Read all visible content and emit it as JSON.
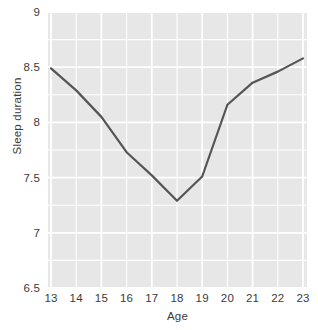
{
  "chart_data": {
    "type": "line",
    "title": "",
    "xlabel": "Age",
    "ylabel": "Sleep duration",
    "x": [
      13,
      14,
      15,
      16,
      17,
      18,
      19,
      20,
      21,
      22,
      23
    ],
    "categories": [
      "13",
      "14",
      "15",
      "16",
      "17",
      "18",
      "19",
      "20",
      "21",
      "22",
      "23"
    ],
    "values": [
      8.49,
      8.29,
      8.05,
      7.73,
      7.52,
      7.29,
      7.51,
      8.16,
      8.36,
      8.46,
      8.58
    ],
    "series": [
      {
        "name": "Sleep duration",
        "values": [
          8.49,
          8.29,
          8.05,
          7.73,
          7.52,
          7.29,
          7.51,
          8.16,
          8.36,
          8.46,
          8.58
        ]
      }
    ],
    "xlim": [
      13,
      23
    ],
    "ylim": [
      6.5,
      9.0
    ],
    "x_ticks": [
      13,
      14,
      15,
      16,
      17,
      18,
      19,
      20,
      21,
      22,
      23
    ],
    "x_tick_labels": [
      "13",
      "14",
      "15",
      "16",
      "17",
      "18",
      "19",
      "20",
      "21",
      "22",
      "23"
    ],
    "y_ticks": [
      6.5,
      7,
      7.5,
      8,
      8.5,
      9
    ],
    "y_tick_labels": [
      "6.5",
      "7",
      "7.5",
      "8",
      "8.5",
      "9"
    ],
    "y_minor_ticks": [
      6.75,
      7.25,
      7.75,
      8.25,
      8.75
    ],
    "grid": true,
    "grid_color": "#ffffff",
    "legend": false,
    "legend_position": "none",
    "plot_background": "#e7e7e7",
    "figure_background": "#ffffff",
    "line_color": "#555555",
    "line_width": 2.2,
    "markers": false,
    "annotations": []
  }
}
